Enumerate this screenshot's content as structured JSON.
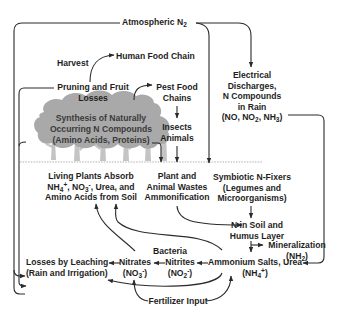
{
  "colors": {
    "line": "#2b2b2b",
    "text": "#1e1e1e",
    "canopy": "#a9a9a9",
    "trunk": "#c4c4c4",
    "ground": "#d8d8d8"
  },
  "nodes": {
    "atmospheric": {
      "text": "Atmospheric N",
      "sub": "2"
    },
    "harvest": "Harvest",
    "human_food_chain": "Human Food Chain",
    "pruning": {
      "line1": "Pruning and Fruit",
      "line2": "Losses"
    },
    "pest_food": {
      "line1": "Pest Food",
      "line2": "Chains"
    },
    "electrical": {
      "line1": "Electrical",
      "line2": "Discharges,",
      "line3": "N Compounds",
      "line4": "in Rain",
      "line5_parts": [
        "(NO, NO",
        "2",
        ", NH",
        "3",
        ")"
      ]
    },
    "synthesis": {
      "line1": "Synthesis of Naturally",
      "line2": "Occurring N Compounds",
      "line3": "(Amino Acids, Proteins)"
    },
    "insects": {
      "line1": "Insects",
      "line2": "Animals"
    },
    "living_plants": {
      "line1": "Living Plants Absorb",
      "line2_parts": [
        "NH",
        "4",
        "+",
        ", NO",
        "3",
        "-",
        ", Urea, and"
      ],
      "line3": "Amino Acids from Soil"
    },
    "plant_wastes": {
      "line1": "Plant and",
      "line2": "Animal Wastes",
      "line3": "Ammonification"
    },
    "symbiotic": {
      "line1": "Symbiotic N-Fixers",
      "line2": "(Legumes and",
      "line3": "Microorganisms)"
    },
    "n_in_soil": {
      "line1": "N in Soil and",
      "line2": "Humus Layer"
    },
    "mineralization": {
      "line1": "Mineralization",
      "line2_parts": [
        "(NH",
        "2",
        ")"
      ]
    },
    "bacteria": "Bacteria",
    "nitrites": {
      "line1": "Nitrites",
      "line2_parts": [
        "(NO",
        "2",
        "-",
        ")"
      ]
    },
    "nitrates": {
      "line1": "Nitrates",
      "line2_parts": [
        "(NO",
        "3",
        "-",
        ")"
      ]
    },
    "ammonium": {
      "line1": "Ammonium Salts, Urea",
      "line2_parts": [
        "(NH",
        "4",
        "+",
        ")"
      ]
    },
    "losses_leaching": {
      "line1": "Losses by Leaching",
      "line2": "(Rain and Irrigation)"
    },
    "fertilizer": "Fertilizer Input"
  }
}
